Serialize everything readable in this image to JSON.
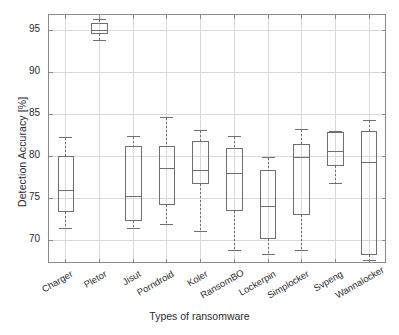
{
  "chart_data": {
    "type": "box",
    "title": "",
    "xlabel": "Types of ransomware",
    "ylabel": "Detection Accuracy [%]",
    "ylim": [
      67.3,
      96.8
    ],
    "yticks": [
      70,
      75,
      80,
      85,
      90,
      95
    ],
    "ytick_labels": [
      "70",
      "75",
      "80",
      "85",
      "90",
      "95"
    ],
    "grid": true,
    "legend": null,
    "categories": [
      "Charger",
      "Pletor",
      "Jisut",
      "Porndroid",
      "Koler",
      "RansomBO",
      "Lockerpin",
      "Simplocker",
      "Svpeng",
      "Wannalocker"
    ],
    "boxes": [
      {
        "label": "Charger",
        "whisker_low": 71.4,
        "q1": 73.4,
        "median": 75.9,
        "q3": 80.0,
        "whisker_high": 82.2
      },
      {
        "label": "Pletor",
        "whisker_low": 93.8,
        "q1": 94.6,
        "median": 95.0,
        "q3": 95.8,
        "whisker_high": 96.3
      },
      {
        "label": "Jisut",
        "whisker_low": 71.4,
        "q1": 72.3,
        "median": 75.2,
        "q3": 81.1,
        "whisker_high": 82.3
      },
      {
        "label": "Porndroid",
        "whisker_low": 71.9,
        "q1": 74.2,
        "median": 78.5,
        "q3": 81.2,
        "whisker_high": 84.6
      },
      {
        "label": "Koler",
        "whisker_low": 71.0,
        "q1": 76.7,
        "median": 78.3,
        "q3": 81.7,
        "whisker_high": 83.1
      },
      {
        "label": "RansomBO",
        "whisker_low": 68.8,
        "q1": 73.6,
        "median": 77.9,
        "q3": 80.9,
        "whisker_high": 82.3
      },
      {
        "label": "Lockerpin",
        "whisker_low": 68.3,
        "q1": 70.2,
        "median": 74.0,
        "q3": 78.3,
        "whisker_high": 79.8
      },
      {
        "label": "Simplocker",
        "whisker_low": 68.8,
        "q1": 73.1,
        "median": 79.8,
        "q3": 81.4,
        "whisker_high": 83.2
      },
      {
        "label": "Svpeng",
        "whisker_low": 76.8,
        "q1": 78.9,
        "median": 80.6,
        "q3": 82.8,
        "whisker_high": 82.9
      },
      {
        "label": "Wannalocker",
        "whisker_low": 67.6,
        "q1": 68.3,
        "median": 79.3,
        "q3": 83.0,
        "whisker_high": 84.2
      }
    ],
    "colors": {
      "box_line": "#6f6f6f",
      "median_line": "#6f6f6f",
      "whisker_line": "#6f6f6f",
      "cap_line": "#6f6f6f",
      "grid": "#d9d9d9",
      "axis": "#8a8a8a",
      "text": "#2b2b2b",
      "background": "#ffffff"
    }
  }
}
